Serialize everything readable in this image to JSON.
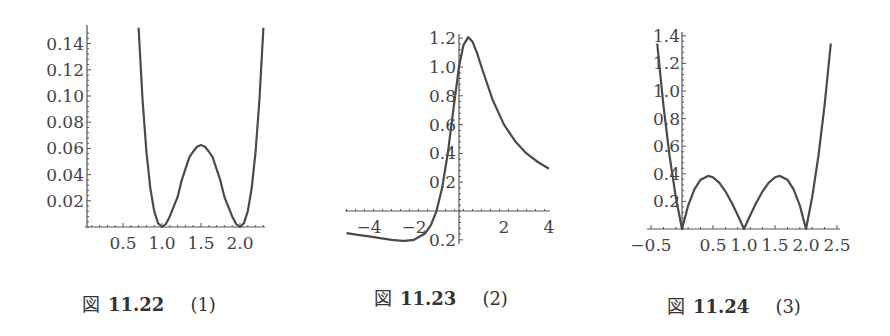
{
  "chart_data": [
    {
      "type": "line",
      "title": "",
      "caption": {
        "fig": "図",
        "number": "11.22",
        "label": "(1)"
      },
      "xlabel": "",
      "ylabel": "",
      "xlim": [
        0,
        2.35
      ],
      "ylim": [
        0,
        0.15
      ],
      "x_ticks": [
        0.5,
        1.0,
        1.5,
        2.0
      ],
      "x_tick_labels": [
        "0.5",
        "1.0",
        "1.5",
        "2.0"
      ],
      "y_ticks": [
        0.02,
        0.04,
        0.06,
        0.08,
        0.1,
        0.12,
        0.14
      ],
      "y_tick_labels": [
        "0.02",
        "0.04",
        "0.06",
        "0.08",
        "0.10",
        "0.12",
        "0.14"
      ],
      "grid": false,
      "series": [
        {
          "name": "f1",
          "x": [
            0.7,
            0.75,
            0.8,
            0.85,
            0.9,
            0.95,
            1.0,
            1.05,
            1.1,
            1.15,
            1.2,
            1.25,
            1.3,
            1.35,
            1.4,
            1.45,
            1.5,
            1.55,
            1.6,
            1.65,
            1.7,
            1.75,
            1.8,
            1.85,
            1.9,
            1.95,
            2.0,
            2.05,
            2.1,
            2.15,
            2.2,
            2.25,
            2.3
          ],
          "y": [
            0.1521,
            0.0977,
            0.0576,
            0.0297,
            0.0121,
            0.0028,
            0.0,
            0.0023,
            0.0081,
            0.0156,
            0.023,
            0.0352,
            0.0441,
            0.0532,
            0.0576,
            0.0613,
            0.0625,
            0.0613,
            0.0576,
            0.0532,
            0.0441,
            0.0352,
            0.023,
            0.0156,
            0.0081,
            0.0023,
            0.0,
            0.0028,
            0.0121,
            0.0297,
            0.0576,
            0.0977,
            0.1521
          ]
        }
      ]
    },
    {
      "type": "line",
      "title": "",
      "caption": {
        "fig": "図",
        "number": "11.23",
        "label": "(2)"
      },
      "xlabel": "",
      "ylabel": "",
      "xlim": [
        -5,
        4
      ],
      "ylim": [
        -0.2,
        1.2
      ],
      "x_ticks": [
        -4,
        -2,
        2,
        4
      ],
      "x_tick_labels": [
        "−4",
        "−2",
        "2",
        "4"
      ],
      "y_ticks": [
        -0.2,
        0.2,
        0.4,
        0.6,
        0.8,
        1.0,
        1.2
      ],
      "y_tick_labels": [
        "0.2",
        "0.2",
        "0.4",
        "0.6",
        "0.8",
        "1.0",
        "1.2"
      ],
      "grid": false,
      "series": [
        {
          "name": "f2",
          "x": [
            -5,
            -4.5,
            -4,
            -3.5,
            -3,
            -2.5,
            -2.414,
            -2,
            -1.5,
            -1.25,
            -1,
            -0.75,
            -0.5,
            -0.25,
            0,
            0.2,
            0.414,
            0.6,
            0.8,
            1,
            1.5,
            2,
            2.5,
            3,
            3.5,
            4
          ],
          "y": [
            -0.154,
            -0.165,
            -0.176,
            -0.189,
            -0.2,
            -0.207,
            -0.207,
            -0.2,
            -0.154,
            -0.098,
            0.0,
            0.16,
            0.4,
            0.706,
            1.0,
            1.154,
            1.207,
            1.176,
            1.098,
            1.0,
            0.769,
            0.6,
            0.483,
            0.4,
            0.34,
            0.294
          ]
        }
      ]
    },
    {
      "type": "line",
      "title": "",
      "caption": {
        "fig": "図",
        "number": "11.24",
        "label": "(3)"
      },
      "xlabel": "",
      "ylabel": "",
      "xlim": [
        -0.5,
        2.5
      ],
      "ylim": [
        0,
        1.4
      ],
      "x_ticks": [
        -0.5,
        0.5,
        1.0,
        1.5,
        2.0,
        2.5
      ],
      "x_tick_labels": [
        "−0.5",
        "0.5",
        "1.0",
        "1.5",
        "2.0",
        "2.5"
      ],
      "y_ticks": [
        0.2,
        0.4,
        0.6,
        0.8,
        1.0,
        1.2,
        1.4
      ],
      "y_tick_labels": [
        "0.2",
        "0.4",
        "0.6",
        "0.8",
        "1.0",
        "1.2",
        "1.4"
      ],
      "grid": false,
      "series": [
        {
          "name": "f3",
          "x": [
            -0.4,
            -0.3,
            -0.2,
            -0.1,
            0,
            0.1,
            0.2,
            0.3,
            0.42,
            0.5,
            0.6,
            0.7,
            0.8,
            0.9,
            1.0,
            1.1,
            1.2,
            1.3,
            1.4,
            1.5,
            1.58,
            1.7,
            1.8,
            1.9,
            2.0,
            2.1,
            2.2,
            2.3,
            2.4
          ],
          "y": [
            1.344,
            0.897,
            0.528,
            0.231,
            0.0,
            0.171,
            0.288,
            0.357,
            0.385,
            0.375,
            0.336,
            0.273,
            0.192,
            0.099,
            0.0,
            0.099,
            0.192,
            0.273,
            0.336,
            0.375,
            0.385,
            0.357,
            0.288,
            0.171,
            0.0,
            0.231,
            0.528,
            0.897,
            1.344
          ]
        }
      ]
    }
  ],
  "figures_layout": [
    {
      "origin_px": [
        84,
        227
      ],
      "px_per_x": 78,
      "px_per_y": 1310,
      "x_axis_px": [
        85,
        265
      ],
      "y_axis_px": [
        25,
        227
      ],
      "y_axis_x_px": 87,
      "y_label_right_px": 84,
      "caption_pos": [
        82,
        290
      ]
    },
    {
      "origin_px": [
        459,
        211
      ],
      "px_per_x": 22.5,
      "px_per_y": 144,
      "x_axis_px": [
        345,
        550
      ],
      "y_axis_px": [
        34,
        244
      ],
      "y_axis_x_px": 459,
      "y_label_right_px": 456,
      "caption_pos": [
        374,
        284
      ]
    },
    {
      "origin_px": [
        682,
        229
      ],
      "px_per_x": 62,
      "px_per_y": 138,
      "x_axis_px": [
        647,
        840
      ],
      "y_axis_px": [
        32,
        229
      ],
      "y_axis_x_px": 682,
      "y_label_right_px": 680,
      "caption_pos": [
        667,
        292
      ]
    }
  ]
}
